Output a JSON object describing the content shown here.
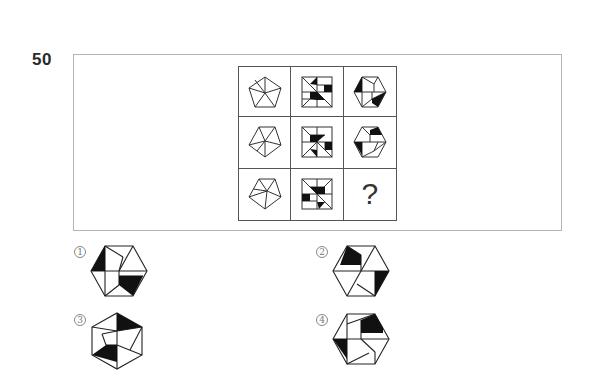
{
  "question": {
    "number": "50",
    "missing_symbol": "?"
  },
  "grid": {
    "rows": [
      {
        "col1": "pentagon-pattern-a",
        "col2": "square-pattern-a",
        "col3": "hexagon-pattern-a"
      },
      {
        "col1": "pentagon-pattern-b",
        "col2": "square-pattern-b",
        "col3": "hexagon-pattern-b"
      },
      {
        "col1": "pentagon-pattern-c",
        "col2": "square-pattern-c",
        "col3": "missing"
      }
    ]
  },
  "options": [
    {
      "label": "1",
      "shape": "hexagon-option-1"
    },
    {
      "label": "2",
      "shape": "hexagon-option-2"
    },
    {
      "label": "3",
      "shape": "hexagon-option-3"
    },
    {
      "label": "4",
      "shape": "hexagon-option-4"
    }
  ],
  "colors": {
    "stroke": "#333333",
    "fill": "#111111",
    "frame": "#b5b5b5",
    "grid": "#555555"
  }
}
